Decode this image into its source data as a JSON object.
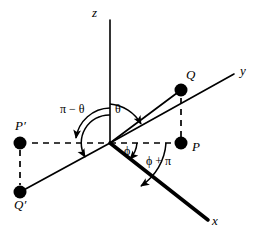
{
  "figure": {
    "background_color": "#ffffff",
    "stroke_color": "#000000",
    "width": 267,
    "height": 238
  },
  "axes": [
    {
      "name": "z-axis",
      "label": "z",
      "label_x": 92,
      "label_y": 6,
      "x1": 110,
      "y1": 143,
      "x2": 110,
      "y2": 20,
      "style": "solid",
      "weight": 1.6
    },
    {
      "name": "y-axis",
      "label": "y",
      "label_x": 240,
      "label_y": 64,
      "x1": 110,
      "y1": 143,
      "x2": 234,
      "y2": 74,
      "style": "solid",
      "weight": 1.6
    },
    {
      "name": "x-axis",
      "label": "x",
      "label_x": 212,
      "label_y": 214,
      "x1": 110,
      "y1": 143,
      "x2": 208,
      "y2": 220,
      "style": "solid",
      "weight": 3.6
    }
  ],
  "points": [
    {
      "name": "point-Q",
      "label": "Q",
      "cx": 181,
      "cy": 90,
      "r": 6.5,
      "label_x": 186,
      "label_y": 68
    },
    {
      "name": "point-P",
      "label": "P",
      "cx": 181,
      "cy": 143,
      "r": 6.5,
      "label_x": 192,
      "label_y": 140
    },
    {
      "name": "point-P-prime",
      "label": "P′",
      "cx": 20,
      "cy": 143,
      "r": 6.5,
      "label_x": 15,
      "label_y": 119
    },
    {
      "name": "point-Q-prime",
      "label": "Q′",
      "cx": 20,
      "cy": 192,
      "r": 6.5,
      "label_x": 14,
      "label_y": 198
    }
  ],
  "solid_rays": [
    {
      "name": "ray-origin-to-Q",
      "x1": 110,
      "y1": 143,
      "x2": 181,
      "y2": 90
    },
    {
      "name": "ray-origin-to-Q-prime",
      "x1": 110,
      "y1": 143,
      "x2": 20,
      "y2": 192
    }
  ],
  "dashed_lines": [
    {
      "name": "dashed-origin-to-P",
      "x1": 110,
      "y1": 143,
      "x2": 175,
      "y2": 143
    },
    {
      "name": "dashed-origin-to-P-prime",
      "x1": 104,
      "y1": 143,
      "x2": 27,
      "y2": 143
    },
    {
      "name": "dashed-P-to-Q",
      "x1": 181,
      "y1": 137,
      "x2": 181,
      "y2": 97
    },
    {
      "name": "dashed-P-prime-to-Q-prime",
      "x1": 20,
      "y1": 150,
      "x2": 20,
      "y2": 185
    }
  ],
  "angle_labels": [
    {
      "name": "angle-label-pi-minus-theta",
      "text": "π − θ",
      "x": 60,
      "y": 103
    },
    {
      "name": "angle-label-theta",
      "text": "θ",
      "x": 115,
      "y": 103
    },
    {
      "name": "angle-label-phi",
      "text": "ϕ",
      "x": 124,
      "y": 145
    },
    {
      "name": "angle-label-phi-plus-pi",
      "text": "ϕ + π",
      "x": 146,
      "y": 155
    }
  ],
  "arcs": [
    {
      "name": "arc-theta",
      "d": "M 110 104 A 39 39 0 0 1 141 124"
    },
    {
      "name": "arc-pi-minus-theta",
      "d": "M 110 108 A 35 35 0 0 0 76 138"
    },
    {
      "name": "arc-pi-minus-theta-outer",
      "d": "M 110 115 A 28 28 0 0 0 85 157"
    },
    {
      "name": "arc-phi-small",
      "d": "M 137 143 A 27 27 0 0 1 130 159"
    },
    {
      "name": "arc-phi-plus-pi",
      "d": "M 166 143 A 56 56 0 0 1 141 186"
    }
  ]
}
